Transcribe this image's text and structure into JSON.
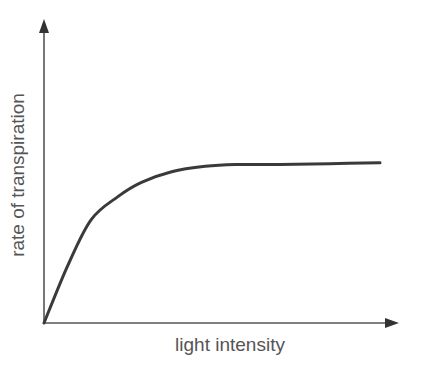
{
  "chart_data": {
    "type": "line",
    "title": "",
    "xlabel": "light intensity",
    "ylabel": "rate of transpiration",
    "grid": false,
    "legend": null,
    "axes": {
      "x_ticks": [],
      "y_ticks": [],
      "arrowheads": true
    },
    "series": [
      {
        "name": "rate of transpiration",
        "description": "rises steeply and roughly linearly from origin, then curves and levels off to a plateau",
        "x": [
          0,
          0.07,
          0.14,
          0.22,
          0.29,
          0.38,
          0.48,
          0.57,
          0.7,
          0.85,
          1.0
        ],
        "y": [
          0,
          0.32,
          0.58,
          0.71,
          0.79,
          0.85,
          0.88,
          0.89,
          0.89,
          0.895,
          0.9
        ]
      }
    ],
    "colors": {
      "line": "#3a3a3a",
      "axes": "#555555",
      "text": "#555555"
    }
  }
}
